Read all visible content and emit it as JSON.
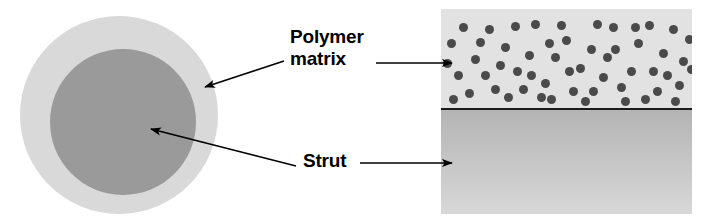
{
  "figure": {
    "colors": {
      "outer_ring": "#d9d9d9",
      "inner_core": "#9a9a9a",
      "matrix_background": "#e2e2e2",
      "particle": "#4a4a4a",
      "divider": "#1c1c1c",
      "strut_gradient_top": "#b4b4b4",
      "strut_gradient_bottom": "#d8d8d8",
      "arrow": "#000000",
      "text": "#000000",
      "page_background": "#ffffff"
    }
  },
  "labels": {
    "polymer_matrix": "Polymer\nmatrix",
    "strut": "Strut"
  },
  "diagram": {
    "cross_section": {
      "outer_label": "polymer matrix coating",
      "inner_label": "strut core"
    },
    "slab": {
      "top_layer_label": "polymer matrix with dispersed particles",
      "bottom_layer_label": "strut"
    }
  },
  "particles": [
    [
      13,
      62
    ],
    [
      35,
      29
    ],
    [
      55,
      52
    ],
    [
      70,
      13
    ],
    [
      84,
      42
    ],
    [
      100,
      70
    ],
    [
      121,
      27
    ],
    [
      135,
      55
    ],
    [
      152,
      11
    ],
    [
      162,
      44
    ],
    [
      176,
      74
    ],
    [
      193,
      30
    ],
    [
      208,
      58
    ],
    [
      228,
      16
    ],
    [
      238,
      48
    ],
    [
      6,
      30
    ],
    [
      24,
      80
    ],
    [
      44,
      16
    ],
    [
      63,
      84
    ],
    [
      90,
      11
    ],
    [
      110,
      44
    ],
    [
      128,
      78
    ],
    [
      146,
      36
    ],
    [
      168,
      14
    ],
    [
      186,
      58
    ],
    [
      200,
      86
    ],
    [
      218,
      40
    ],
    [
      234,
      72
    ],
    [
      8,
      86
    ],
    [
      30,
      46
    ],
    [
      50,
      76
    ],
    [
      72,
      58
    ],
    [
      96,
      84
    ],
    [
      116,
      12
    ],
    [
      140,
      88
    ],
    [
      158,
      64
    ],
    [
      180,
      88
    ],
    [
      204,
      12
    ],
    [
      222,
      62
    ],
    [
      244,
      26
    ],
    [
      18,
      14
    ],
    [
      40,
      62
    ],
    [
      60,
      34
    ],
    [
      78,
      76
    ],
    [
      104,
      30
    ],
    [
      124,
      58
    ],
    [
      148,
      78
    ],
    [
      170,
      36
    ],
    [
      190,
      14
    ],
    [
      212,
      78
    ],
    [
      230,
      88
    ],
    [
      246,
      56
    ],
    [
      2,
      50
    ],
    [
      86,
      62
    ],
    [
      106,
      86
    ]
  ]
}
